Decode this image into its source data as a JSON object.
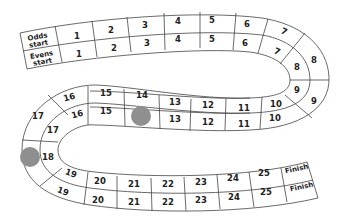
{
  "board": {
    "lanes": [
      "Odds",
      "Evens"
    ],
    "start_labels": {
      "odds": [
        "Odds",
        "start"
      ],
      "evens": [
        "Evens",
        "start"
      ]
    },
    "finish_label": "Finish",
    "outer_lane": {
      "name": "Odds lane",
      "squares": [
        "1",
        "2",
        "3",
        "4",
        "5",
        "6",
        "7",
        "8",
        "9",
        "10",
        "11",
        "12",
        "13",
        "14",
        "15",
        "16",
        "17",
        "18",
        "19",
        "20",
        "21",
        "22",
        "23",
        "24",
        "25"
      ]
    },
    "inner_lane": {
      "name": "Evens lane",
      "squares": [
        "1",
        "2",
        "3",
        "4",
        "5",
        "6",
        "7",
        "8",
        "9",
        "10",
        "11",
        "12",
        "13",
        "14",
        "15",
        "16",
        "17",
        "18",
        "19",
        "20",
        "21",
        "22",
        "23",
        "24",
        "25"
      ]
    },
    "counters": [
      {
        "lane": "inner",
        "square": "14",
        "color": "#8f8f8f"
      },
      {
        "lane": "outer",
        "square": "18",
        "color": "#8f8f8f"
      }
    ],
    "colors": {
      "line": "#444444",
      "counter": "#8f8f8f",
      "background": "#ffffff"
    }
  }
}
